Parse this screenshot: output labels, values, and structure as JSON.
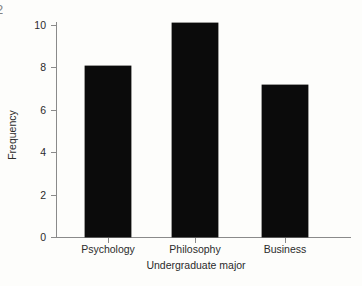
{
  "figure": {
    "background_color": "#fdfdfb",
    "bar_color": "#0b0b0b",
    "axis_color": "#8a8a8a",
    "text_color": "#2b2b2b",
    "edge_fragment": "2"
  },
  "chart_data": {
    "type": "bar",
    "title": "",
    "xlabel": "Undergraduate major",
    "ylabel": "Frequency",
    "categories": [
      "Psychology",
      "Philosophy",
      "Business"
    ],
    "values": [
      8.05,
      10.1,
      7.15
    ],
    "ylim": [
      0,
      10.6
    ],
    "yticks": [
      0,
      2,
      4,
      6,
      8,
      10
    ],
    "ytick_labels": [
      "0",
      "2",
      "4",
      "6",
      "8",
      "10"
    ],
    "grid": false,
    "legend": null,
    "orientation": "vertical",
    "bar_width_px": 46
  }
}
